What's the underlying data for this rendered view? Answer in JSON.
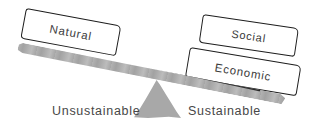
{
  "diagram": {
    "colors": {
      "background": "#ffffff",
      "plank_gray": "#a9a9a9",
      "fulcrum_gray": "#a8a8a8",
      "box_border": "#1d1d1d",
      "text": "#3c3c3c",
      "caption_text": "#474747"
    },
    "boxes": [
      {
        "id": "natural",
        "label": "Natural",
        "side": "left-raised"
      },
      {
        "id": "social",
        "label": "Social",
        "side": "right-lowered-top"
      },
      {
        "id": "economic",
        "label": "Economic",
        "side": "right-lowered-bottom"
      }
    ],
    "captions": {
      "left": "Unsustainable",
      "right": "Sustainable"
    }
  }
}
